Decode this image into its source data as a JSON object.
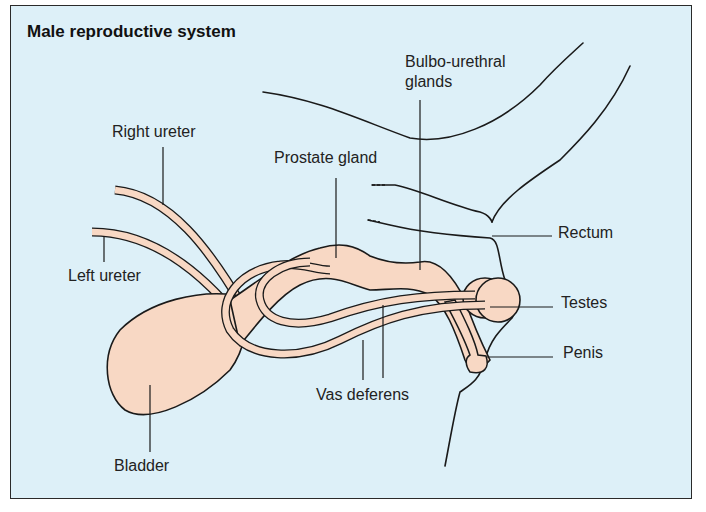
{
  "title": "Male reproductive system",
  "colors": {
    "background": "#ddf0f8",
    "tissue": "#f8d8c4",
    "outline": "#1a1a1a"
  },
  "labels": {
    "right_ureter": "Right ureter",
    "left_ureter": "Left ureter",
    "prostate_gland": "Prostate gland",
    "bulbo_urethral_1": "Bulbo-urethral",
    "bulbo_urethral_2": "glands",
    "rectum": "Rectum",
    "testes": "Testes",
    "penis": "Penis",
    "vas_deferens": "Vas deferens",
    "bladder": "Bladder"
  }
}
